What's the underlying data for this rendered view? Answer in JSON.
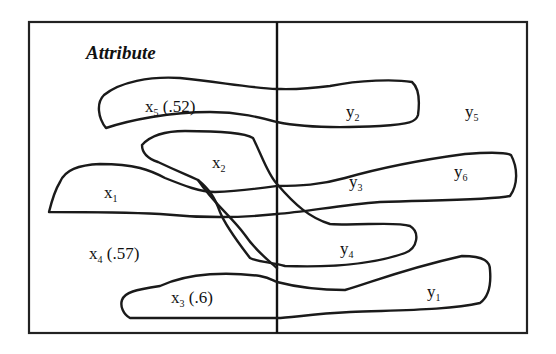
{
  "diagram": {
    "title": "Attribute",
    "left_nodes": [
      {
        "id": "x5",
        "name": "x",
        "sub": "5",
        "value": "(.52)"
      },
      {
        "id": "x2",
        "name": "x",
        "sub": "2",
        "value": ""
      },
      {
        "id": "x1",
        "name": "x",
        "sub": "1",
        "value": ""
      },
      {
        "id": "x4",
        "name": "x",
        "sub": "4",
        "value": "(.57)"
      },
      {
        "id": "x3",
        "name": "x",
        "sub": "3",
        "value": "(.6)"
      }
    ],
    "right_nodes": [
      {
        "id": "y2",
        "name": "y",
        "sub": "2"
      },
      {
        "id": "y5",
        "name": "y",
        "sub": "5"
      },
      {
        "id": "y3",
        "name": "y",
        "sub": "3"
      },
      {
        "id": "y6",
        "name": "y",
        "sub": "6"
      },
      {
        "id": "y4",
        "name": "y",
        "sub": "4"
      },
      {
        "id": "y1",
        "name": "y",
        "sub": "1"
      }
    ],
    "links": [
      {
        "from": "x5",
        "to": "y2"
      },
      {
        "from": "x2",
        "to": "y3"
      },
      {
        "from": "x2",
        "to": "y4"
      },
      {
        "from": "x1",
        "to": "y3"
      },
      {
        "from": "x1",
        "to": "y6"
      },
      {
        "from": "x3",
        "to": "y1"
      }
    ],
    "colors": {
      "stroke": "#1a1a1a",
      "background": "#ffffff"
    }
  }
}
